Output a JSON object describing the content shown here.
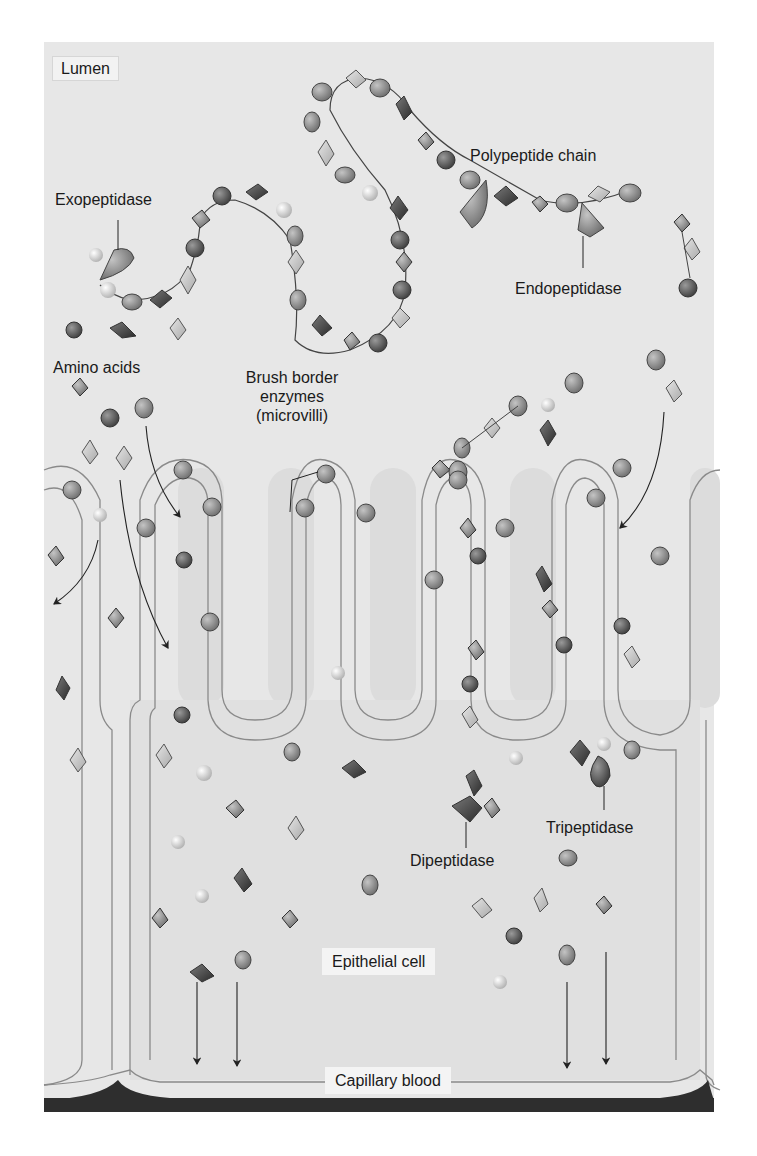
{
  "figure": {
    "colors": {
      "lumen_bg": "#e8e8e8",
      "cell_bg": "#dedede",
      "microvilli": "#d2d2d2",
      "membrane": "#8a8a8a",
      "blood": "#2e2e2e",
      "bead_dark": "#555555",
      "bead_mid": "#8a8a8a",
      "bead_light": "#c8c8c8",
      "text": "#1a1a1a"
    }
  },
  "labels": {
    "lumen": "Lumen",
    "polypeptide_chain": "Polypeptide chain",
    "exopeptidase": "Exopeptidase",
    "endopeptidase": "Endopeptidase",
    "amino_acids": "Amino acids",
    "brush_border_line1": "Brush border",
    "brush_border_line2": "enzymes",
    "brush_border_line3": "(microvilli)",
    "tripeptidase": "Tripeptidase",
    "dipeptidase": "Dipeptidase",
    "epithelial_cell": "Epithelial cell",
    "capillary_blood": "Capillary blood"
  }
}
